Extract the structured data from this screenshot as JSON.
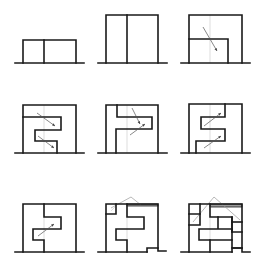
{
  "diagram": {
    "title": "",
    "colors": {
      "line": "#1a1a1a",
      "guide": "#c8c8c8",
      "arrow": "#555555",
      "roof": "#9a9a9a"
    },
    "panels": [
      {
        "id": "panel-1",
        "ground": [
          15,
          63,
          84,
          63
        ],
        "thick": [
          "M23 63 V40 H76 V63",
          "M44 40 V63"
        ],
        "thin": [],
        "arrows": [],
        "roof": [],
        "bands": []
      },
      {
        "id": "panel-2",
        "ground": [
          98,
          63,
          167,
          63
        ],
        "thick": [
          "M106 63 V15 H158 V63",
          "M127 15 V63"
        ],
        "thin": [],
        "arrows": [],
        "roof": [],
        "bands": []
      },
      {
        "id": "panel-3",
        "ground": [
          181,
          63,
          250,
          63
        ],
        "thick": [
          "M189 63 V15 H242 V63",
          "M189 39 H228 V63"
        ],
        "thin": [
          "M210 15 V63"
        ],
        "arrows": [
          [
            203,
            27,
            217,
            51
          ]
        ],
        "roof": [],
        "bands": []
      },
      {
        "id": "panel-4",
        "ground": [
          15,
          153,
          84,
          153
        ],
        "thick": [
          "M23 153 V105 H76 V153",
          "M23 117 H61 V130 H35 V141 H57 V153"
        ],
        "thin": [
          "M44 105 V153"
        ],
        "arrows": [
          [
            37,
            113,
            55,
            126
          ],
          [
            38,
            136,
            54,
            148
          ]
        ],
        "roof": [],
        "bands": []
      },
      {
        "id": "panel-5",
        "ground": [
          98,
          153,
          167,
          153
        ],
        "thick": [
          "M106 153 V105 H158 V153",
          "M117 105 V117 H152 V129 H116 V153"
        ],
        "thin": [
          "M127 105 V153"
        ],
        "arrows": [
          [
            132,
            108,
            140,
            124
          ],
          [
            130,
            135,
            145,
            124
          ]
        ],
        "roof": [],
        "bands": []
      },
      {
        "id": "panel-6",
        "ground": [
          181,
          153,
          250,
          153
        ],
        "thick": [
          "M189 153 V104 H242 V153",
          "M225 104 V117 H201 V129 H225 V141 H196 V153"
        ],
        "thin": [
          "M210 104 V153"
        ],
        "arrows": [
          [
            204,
            126,
            221,
            113
          ],
          [
            204,
            148,
            221,
            136
          ]
        ],
        "roof": [],
        "bands": []
      },
      {
        "id": "panel-7",
        "ground": [
          15,
          252,
          84,
          252
        ],
        "thick": [
          "M23 252 V204 H76 V252",
          "M44 204 V217 H61 V229 H33 V240 H44 V252"
        ],
        "thin": [
          "M44 204 V252"
        ],
        "arrows": [
          [
            38,
            236,
            54,
            224
          ]
        ],
        "roof": [],
        "bands": []
      },
      {
        "id": "panel-8",
        "ground": [
          98,
          252,
          147,
          252
        ],
        "thick": [
          "M106 252 V204 H158 V248",
          "M106 214 H116 V204",
          "M127 204 V217 H144 V229 H116 V240 H127 V252",
          "M147 252 V248 H158 V251 H166"
        ],
        "thin": [
          "M127 204 V252",
          "M111 211 L116 206"
        ],
        "arrows": [],
        "roof": [
          [
            111,
            208,
            131,
            197
          ],
          [
            131,
            197,
            141,
            205
          ]
        ],
        "bands": [
          [
            127,
            204,
            31,
            2
          ]
        ]
      },
      {
        "id": "panel-9",
        "ground": [
          181,
          252,
          232,
          252
        ],
        "thick": [
          "M189 252 V204 H242 V248",
          "M189 214 H200 V204",
          "M189 225 H200 V214",
          "M210 204 V217 H232 V232 H242",
          "M232 222 H242",
          "M232 217 V232",
          "M218 217 V229 H232 V240 H199 V229 H218",
          "M210 240 V252",
          "M232 240 V248 H242",
          "M232 252 V248 H242 V252 H250"
        ],
        "thin": [
          "M210 204 V252"
        ],
        "arrows": [],
        "roof": [
          [
            193,
            222,
            214,
            197
          ],
          [
            214,
            197,
            240,
            220
          ]
        ],
        "bands": [
          [
            210,
            204,
            32,
            3
          ]
        ]
      }
    ]
  }
}
